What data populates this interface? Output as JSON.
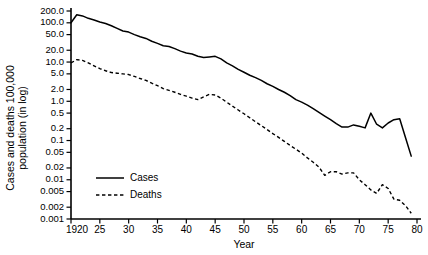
{
  "chart_data": {
    "type": "line",
    "title": "",
    "xlabel": "Year",
    "ylabel": "Cases and deaths 100,000 population (in log)",
    "yscale": "log",
    "ylim": [
      0.001,
      200.0
    ],
    "xlim": [
      1920,
      1980
    ],
    "grid": false,
    "legend_position": "lower-left",
    "ytick_labels": [
      "200.0",
      "100.0",
      "50.0",
      "20.0",
      "10.0",
      "5.0",
      "2.0",
      "1.0",
      "0.5",
      "0.2",
      "0.1",
      "0.05",
      "0.02",
      "0.01",
      "0.005",
      "0.002",
      "0.001"
    ],
    "ytick_values": [
      200.0,
      100.0,
      50.0,
      20.0,
      10.0,
      5.0,
      2.0,
      1.0,
      0.5,
      0.2,
      0.1,
      0.05,
      0.02,
      0.01,
      0.005,
      0.002,
      0.001
    ],
    "xtick_labels": [
      "1920",
      "25",
      "30",
      "35",
      "40",
      "45",
      "50",
      "55",
      "60",
      "65",
      "70",
      "75",
      "80"
    ],
    "xtick_values": [
      1920,
      1925,
      1930,
      1935,
      1940,
      1945,
      1950,
      1955,
      1960,
      1965,
      1970,
      1975,
      1980
    ],
    "series": [
      {
        "name": "Cases",
        "style": "solid",
        "color": "#000000",
        "x": [
          1920,
          1921,
          1922,
          1923,
          1924,
          1925,
          1926,
          1927,
          1928,
          1929,
          1930,
          1931,
          1932,
          1933,
          1934,
          1935,
          1936,
          1937,
          1938,
          1939,
          1940,
          1941,
          1942,
          1943,
          1944,
          1945,
          1946,
          1947,
          1948,
          1949,
          1950,
          1951,
          1952,
          1953,
          1954,
          1955,
          1956,
          1957,
          1958,
          1959,
          1960,
          1961,
          1962,
          1963,
          1964,
          1965,
          1966,
          1967,
          1968,
          1969,
          1970,
          1971,
          1972,
          1973,
          1974,
          1975,
          1976,
          1977,
          1978,
          1979
        ],
        "y": [
          100,
          160,
          150,
          130,
          118,
          105,
          96,
          84,
          72,
          62,
          58,
          50,
          44,
          40,
          34,
          30,
          26,
          25,
          22,
          19,
          17,
          16,
          14,
          13,
          13.5,
          14,
          12,
          9.5,
          8,
          6.5,
          5.5,
          4.6,
          4.0,
          3.4,
          2.8,
          2.4,
          2.0,
          1.7,
          1.4,
          1.1,
          0.95,
          0.8,
          0.65,
          0.52,
          0.42,
          0.34,
          0.27,
          0.22,
          0.22,
          0.25,
          0.23,
          0.21,
          0.5,
          0.26,
          0.21,
          0.28,
          0.34,
          0.36,
          0.12,
          0.04
        ]
      },
      {
        "name": "Deaths",
        "style": "dashed",
        "color": "#000000",
        "x": [
          1920,
          1921,
          1922,
          1923,
          1924,
          1925,
          1926,
          1927,
          1928,
          1929,
          1930,
          1931,
          1932,
          1933,
          1934,
          1935,
          1936,
          1937,
          1938,
          1939,
          1940,
          1941,
          1942,
          1943,
          1944,
          1945,
          1946,
          1947,
          1948,
          1949,
          1950,
          1951,
          1952,
          1953,
          1954,
          1955,
          1956,
          1957,
          1958,
          1959,
          1960,
          1961,
          1962,
          1963,
          1964,
          1965,
          1966,
          1967,
          1968,
          1969,
          1970,
          1971,
          1972,
          1973,
          1974,
          1975,
          1976,
          1977,
          1978,
          1979
        ],
        "y": [
          9.5,
          11.5,
          11.0,
          9.5,
          8.0,
          6.8,
          6.0,
          5.4,
          5.2,
          5.0,
          4.8,
          4.3,
          3.8,
          3.4,
          2.9,
          2.5,
          2.1,
          1.9,
          1.7,
          1.5,
          1.35,
          1.2,
          1.1,
          1.3,
          1.5,
          1.45,
          1.2,
          0.95,
          0.75,
          0.6,
          0.48,
          0.38,
          0.3,
          0.24,
          0.19,
          0.15,
          0.12,
          0.095,
          0.075,
          0.06,
          0.048,
          0.036,
          0.028,
          0.021,
          0.013,
          0.016,
          0.016,
          0.014,
          0.015,
          0.015,
          0.01,
          0.0075,
          0.0055,
          0.0045,
          0.0075,
          0.006,
          0.0032,
          0.003,
          0.0022,
          0.0014
        ]
      }
    ]
  },
  "legend": {
    "items": [
      {
        "label": "Cases",
        "style": "solid"
      },
      {
        "label": "Deaths",
        "style": "dashed"
      }
    ]
  }
}
